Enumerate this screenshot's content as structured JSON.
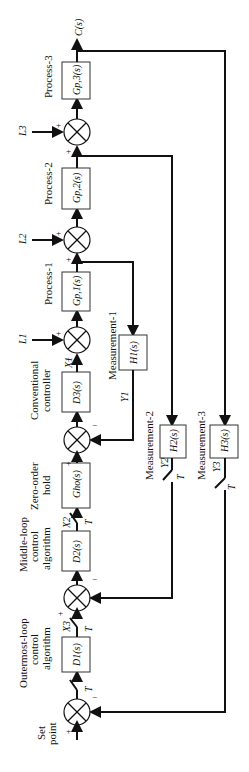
{
  "diagram": {
    "blocks": {
      "gp3": "Gp,3(s)",
      "gp2": "Gp,2(s)",
      "gp1": "Gp,1(s)",
      "d3": "D3(s)",
      "h1": "H1(s)",
      "gho": "Gho(s)",
      "d2": "D2(s)",
      "h2": "H2(s)",
      "h3": "H3(s)",
      "d1": "D1(s)"
    },
    "labels": {
      "output": "C(s)",
      "process3": "Process-3",
      "process2": "Process-2",
      "process1": "Process-1",
      "conventional": "Conventional",
      "controller": "controller",
      "measurement1": "Measurement-1",
      "measurement2": "Measurement-2",
      "measurement3": "Measurement-3",
      "zoh1": "Zero-order",
      "zoh2": "hold",
      "middle1": "Middle-loop",
      "middle2": "control",
      "middle3": "algorithm",
      "outer1": "Outermost-loop",
      "outer2": "control",
      "outer3": "algorithm",
      "set1": "Set",
      "set2": "point",
      "L3": "L3",
      "L2": "L2",
      "L1": "L1",
      "X1": "X1",
      "X2": "X2",
      "X3": "X3",
      "Y1": "Y1",
      "Y2": "Y2",
      "Y3": "Y3",
      "T": "T",
      "plus": "+",
      "minus": "−"
    }
  }
}
